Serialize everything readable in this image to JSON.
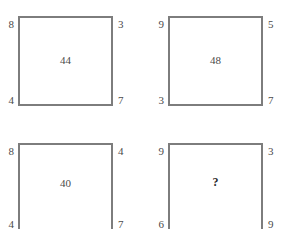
{
  "canvas": {
    "width": 282,
    "height": 229,
    "background_color": "#ffffff",
    "line_color": "#7d7d7d",
    "text_color": "#4a4a4a"
  },
  "puzzle": {
    "unknown_marker": "?",
    "panels": [
      {
        "id": "panel-1",
        "position": "top-left",
        "corners": {
          "top_left": "8",
          "top_right": "3",
          "bottom_left": "4",
          "bottom_right": "7"
        },
        "center": "44",
        "is_unknown": false,
        "bottom_clipped": false
      },
      {
        "id": "panel-2",
        "position": "top-right",
        "corners": {
          "top_left": "9",
          "top_right": "5",
          "bottom_left": "3",
          "bottom_right": "7"
        },
        "center": "48",
        "is_unknown": false,
        "bottom_clipped": false
      },
      {
        "id": "panel-3",
        "position": "bottom-left",
        "corners": {
          "top_left": "8",
          "top_right": "4",
          "bottom_left": "4",
          "bottom_right": "7"
        },
        "center": "40",
        "is_unknown": false,
        "bottom_clipped": true
      },
      {
        "id": "panel-4",
        "position": "bottom-right",
        "corners": {
          "top_left": "9",
          "top_right": "3",
          "bottom_left": "6",
          "bottom_right": "9"
        },
        "center": "?",
        "is_unknown": true,
        "bottom_clipped": true
      }
    ]
  }
}
